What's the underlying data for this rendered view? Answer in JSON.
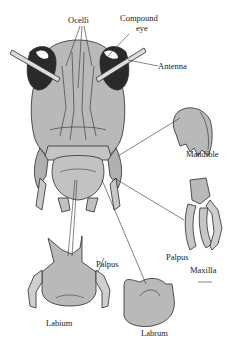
{
  "diagram": {
    "colors": {
      "fill": "#b9b9b9",
      "fill_light": "#cfcfcf",
      "eye": "#2a2a2a",
      "stroke": "#2b2b2b",
      "leader": "#333333"
    },
    "labels": {
      "ocelli": "Ocelli",
      "compound_eye_line1": "Compound",
      "compound_eye_line2": "eye",
      "antenna": "Antenna",
      "mandible": "Mandible",
      "palpus_maxilla": "Palpus",
      "maxilla": "Maxilla",
      "palpus_labium": "Palpus",
      "labium": "Labium",
      "labrum": "Labrum"
    }
  }
}
